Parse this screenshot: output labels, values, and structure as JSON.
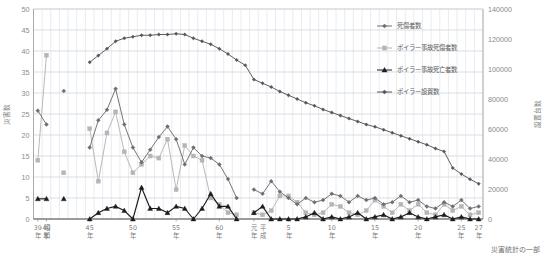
{
  "chart_data": {
    "type": "line",
    "title": "",
    "xlabel": "",
    "ylabel": "災害数",
    "y2label": "設置台数",
    "ylim": [
      0,
      50
    ],
    "y2lim": [
      0,
      140000
    ],
    "grid": true,
    "legend_position": "top-right",
    "y_ticks": [
      "0",
      "5",
      "10",
      "15",
      "20",
      "25",
      "30",
      "35",
      "40",
      "45",
      "50"
    ],
    "y2_ticks": [
      "0",
      "20000",
      "40000",
      "60000",
      "80000",
      "100000",
      "120000",
      "140000"
    ],
    "x_tick_labels": [
      {
        "index": 0,
        "line1": "39",
        "line2": "年",
        "era": "昭和"
      },
      {
        "index": 1,
        "line1": "40",
        "line2": "年",
        "era": ""
      },
      {
        "index": 6,
        "line1": "45",
        "line2": "年",
        "era": ""
      },
      {
        "index": 11,
        "line1": "50",
        "line2": "年",
        "era": ""
      },
      {
        "index": 16,
        "line1": "55",
        "line2": "年",
        "era": ""
      },
      {
        "index": 21,
        "line1": "60",
        "line2": "年",
        "era": ""
      },
      {
        "index": 25,
        "line1": "元",
        "line2": "年",
        "era": "平成"
      },
      {
        "index": 29,
        "line1": "5",
        "line2": "年",
        "era": ""
      },
      {
        "index": 34,
        "line1": "10",
        "line2": "年",
        "era": ""
      },
      {
        "index": 39,
        "line1": "15",
        "line2": "年",
        "era": ""
      },
      {
        "index": 44,
        "line1": "20",
        "line2": "年",
        "era": ""
      },
      {
        "index": 49,
        "line1": "25",
        "line2": "年",
        "era": ""
      },
      {
        "index": 51,
        "line1": "27",
        "line2": "年",
        "era": ""
      }
    ],
    "categories": [
      "昭和39",
      "昭和40",
      "昭和41",
      "昭和42",
      "昭和43",
      "昭和44",
      "昭和45",
      "昭和46",
      "昭和47",
      "昭和48",
      "昭和49",
      "昭和50",
      "昭和51",
      "昭和52",
      "昭和53",
      "昭和54",
      "昭和55",
      "昭和56",
      "昭和57",
      "昭和58",
      "昭和59",
      "昭和60",
      "昭和61",
      "昭和62",
      "昭和63",
      "平成元",
      "平成2",
      "平成3",
      "平成4",
      "平成5",
      "平成6",
      "平成7",
      "平成8",
      "平成9",
      "平成10",
      "平成11",
      "平成12",
      "平成13",
      "平成14",
      "平成15",
      "平成16",
      "平成17",
      "平成18",
      "平成19",
      "平成20",
      "平成21",
      "平成22",
      "平成23",
      "平成24",
      "平成25",
      "平成26",
      "平成27"
    ],
    "series": [
      {
        "name": "死傷者数",
        "key": "shishosha",
        "color": "#6e6e6e",
        "marker": "diamond",
        "axis": "left",
        "values": [
          25.8,
          22.5,
          null,
          30.5,
          null,
          null,
          17.0,
          23.5,
          26.0,
          31.0,
          22.5,
          17.0,
          13.5,
          16.5,
          19.5,
          22.0,
          19.0,
          13.0,
          17.0,
          15.0,
          14.5,
          13.0,
          9.5,
          5.0,
          null,
          7.0,
          6.0,
          9.0,
          6.5,
          5.0,
          3.5,
          5.0,
          4.0,
          4.5,
          6.0,
          5.5,
          4.0,
          5.5,
          4.5,
          5.0,
          3.5,
          4.0,
          5.5,
          4.0,
          4.5,
          3.0,
          2.5,
          4.0,
          3.0,
          4.5,
          2.5,
          3.0
        ]
      },
      {
        "name": "ボイラー事故死傷者数",
        "key": "boiler_casualties",
        "color": "#b5b5b5",
        "marker": "square",
        "axis": "left",
        "values": [
          14.0,
          39.0,
          null,
          11.0,
          null,
          null,
          21.5,
          9.0,
          20.5,
          25.5,
          16.0,
          11.0,
          13.0,
          15.0,
          14.5,
          19.0,
          7.0,
          17.5,
          15.0,
          14.0,
          5.0,
          3.5,
          1.5,
          1.0,
          null,
          1.5,
          1.0,
          2.0,
          5.5,
          5.5,
          4.0,
          1.5,
          1.0,
          1.5,
          3.5,
          3.0,
          1.5,
          1.0,
          2.0,
          4.5,
          3.0,
          1.5,
          3.5,
          2.0,
          3.5,
          1.5,
          1.0,
          3.5,
          2.0,
          3.0,
          1.0,
          1.5
        ]
      },
      {
        "name": "ボイラー事故死亡者数",
        "key": "boiler_deaths",
        "color": "#1c1c1c",
        "marker": "triangle",
        "axis": "left",
        "values": [
          4.8,
          4.8,
          null,
          4.8,
          null,
          null,
          0.0,
          1.5,
          2.5,
          3.0,
          2.0,
          0.0,
          7.5,
          2.5,
          2.5,
          1.5,
          3.0,
          2.5,
          0.0,
          2.5,
          6.0,
          3.0,
          3.0,
          0.0,
          null,
          1.5,
          3.0,
          0.0,
          0.0,
          0.0,
          0.0,
          0.5,
          1.5,
          0.0,
          0.5,
          0.0,
          0.5,
          1.5,
          0.0,
          0.5,
          1.0,
          0.0,
          0.5,
          1.5,
          0.5,
          0.0,
          0.5,
          1.0,
          0.0,
          0.5,
          0.0,
          0.0
        ]
      },
      {
        "name": "ボイラー設置数",
        "key": "boiler_installed",
        "color": "#565656",
        "marker": "diamond",
        "axis": "right",
        "values": [
          null,
          null,
          null,
          null,
          null,
          null,
          104500,
          109000,
          113500,
          118500,
          120500,
          121500,
          122500,
          122500,
          123000,
          123000,
          123500,
          123000,
          120500,
          118500,
          116500,
          113500,
          110000,
          106000,
          102500,
          93000,
          90500,
          88000,
          85000,
          82500,
          80000,
          77500,
          75500,
          73000,
          71000,
          69000,
          67000,
          65000,
          63000,
          61500,
          59500,
          57500,
          55500,
          53500,
          51500,
          49500,
          47000,
          45000,
          34000,
          30000,
          26500,
          23500
        ]
      }
    ],
    "caption": "災害統計の一部"
  },
  "legend": {
    "items": [
      {
        "label": "死傷者数",
        "color": "#6e6e6e",
        "marker": "diamond"
      },
      {
        "label": "ボイラー事故死傷者数",
        "color": "#b5b5b5",
        "marker": "square"
      },
      {
        "label": "ボイラー事故死亡者数",
        "color": "#1c1c1c",
        "marker": "triangle"
      },
      {
        "label": "ボイラー設置数",
        "color": "#565656",
        "marker": "diamond"
      }
    ]
  }
}
